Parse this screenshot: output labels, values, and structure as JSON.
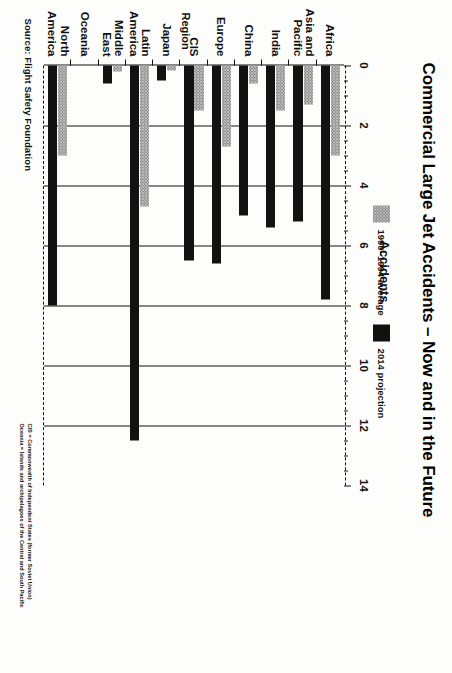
{
  "source": "Source: Flight Safety Foundation",
  "title": "Commercial Large Jet Accidents – Now and in the Future",
  "footnote": {
    "line1": "CIS = Commonwealth of Independent States (former Soviet Union)",
    "line2": "Oceania = Islands and archipelagoes of the Central and South Pacific"
  },
  "legend": {
    "items": [
      {
        "label": "1990–1994 average",
        "color": "#b9b9b9",
        "swatch": "light-stipple"
      },
      {
        "label": "2014 projection",
        "color": "#121212",
        "swatch": "solid-black"
      }
    ]
  },
  "chart_data": {
    "type": "bar",
    "orientation": "horizontal",
    "title": "Commercial Large Jet Accidents – Now and in the Future",
    "xlabel": "Accidents",
    "ylabel": "Region",
    "xlim": [
      0,
      14
    ],
    "xticks": [
      0,
      2,
      4,
      6,
      8,
      10,
      12,
      14
    ],
    "xticklabels": [
      "0",
      "2",
      "4",
      "6",
      "8",
      "10",
      "12",
      "14"
    ],
    "minor_tick_step": 0.5,
    "grid": "vertical-major",
    "legend_position": "top-left",
    "categories": [
      "Africa",
      "Asia and\nPacific",
      "India",
      "China",
      "Europe",
      "CIS",
      "Japan",
      "Latin\nAmerica",
      "Middle\nEast",
      "Oceania",
      "North\nAmerica"
    ],
    "series": [
      {
        "name": "1990–1994 average",
        "color": "#b9b9b9",
        "values": [
          3.0,
          1.3,
          1.5,
          0.6,
          2.7,
          1.5,
          0.15,
          4.7,
          0.2,
          0.0,
          3.0
        ]
      },
      {
        "name": "2014 projection",
        "color": "#121212",
        "values": [
          7.8,
          5.2,
          5.4,
          5.0,
          6.6,
          6.5,
          0.5,
          12.5,
          0.6,
          0.0,
          8.0
        ]
      }
    ]
  }
}
